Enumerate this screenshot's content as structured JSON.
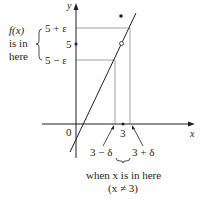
{
  "diagram": {
    "axes": {
      "x_label": "x",
      "y_label": "y",
      "origin_label": "0"
    },
    "y_ticks": {
      "upper": "5 + ε",
      "center": "5",
      "lower": "5 − ε"
    },
    "x_ticks": {
      "center": "3",
      "left": "3 − δ",
      "right": "3 + δ"
    },
    "left_note": {
      "line1": "f(x)",
      "line2": "is in",
      "line3": "here"
    },
    "bottom_note": {
      "line1": "when x is in here",
      "line2": "(x ≠ 3)"
    },
    "colors": {
      "ink": "#231f20",
      "guide": "#8a8a8a",
      "line": "#231f20"
    }
  }
}
